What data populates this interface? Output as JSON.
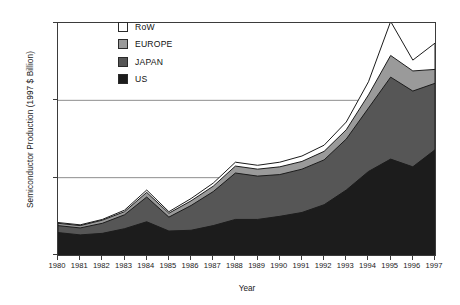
{
  "chart_data": {
    "type": "area",
    "stacked": true,
    "title": "",
    "xlabel": "Year",
    "ylabel": "Semiconductor Production (1997 $ Billion)",
    "x": [
      1980,
      1981,
      1982,
      1983,
      1984,
      1985,
      1986,
      1987,
      1988,
      1989,
      1990,
      1991,
      1992,
      1993,
      1994,
      1995,
      1996,
      1997
    ],
    "categories": [
      "1980",
      "1981",
      "1982",
      "1983",
      "1984",
      "1985",
      "1986",
      "1987",
      "1988",
      "1989",
      "1990",
      "1991",
      "1992",
      "1993",
      "1994",
      "1995",
      "1996",
      "1997"
    ],
    "xlim": [
      1980,
      1997
    ],
    "ylim": [
      0,
      150
    ],
    "yticks": [
      0,
      50,
      100,
      150
    ],
    "xticks": [
      "1980",
      "1981",
      "1982",
      "1983",
      "1984",
      "1985",
      "1986",
      "1987",
      "1988",
      "1989",
      "1990",
      "1991",
      "1992",
      "1993",
      "1994",
      "1995",
      "1996",
      "1997"
    ],
    "grid": "horizontal",
    "legend_position": "upper-left-inside",
    "series": [
      {
        "name": "US",
        "color": "#1c1c1c",
        "values": [
          14.5,
          13.0,
          14.0,
          17.0,
          21.5,
          15.5,
          16.0,
          19.0,
          23.0,
          23.0,
          25.0,
          27.5,
          32.5,
          42.0,
          54.0,
          62.0,
          57.0,
          68.0
        ]
      },
      {
        "name": "JAPAN",
        "color": "#565656",
        "values": [
          4.5,
          4.5,
          6.5,
          9.0,
          16.0,
          9.0,
          16.0,
          22.0,
          30.0,
          28.0,
          27.0,
          28.0,
          29.0,
          33.0,
          41.0,
          53.0,
          49.0,
          43.0
        ]
      },
      {
        "name": "EUROPE",
        "color": "#9a9a9a",
        "values": [
          1.5,
          1.5,
          2.0,
          2.0,
          3.0,
          2.5,
          3.0,
          3.5,
          4.5,
          4.5,
          5.0,
          5.0,
          5.5,
          6.0,
          8.5,
          14.0,
          13.0,
          9.0
        ]
      },
      {
        "name": "RoW",
        "color": "#ffffff",
        "values": [
          0.5,
          0.5,
          0.5,
          1.0,
          1.5,
          1.0,
          1.5,
          2.0,
          2.5,
          2.5,
          3.0,
          3.5,
          4.0,
          5.0,
          8.5,
          22.0,
          7.0,
          17.0
        ]
      }
    ],
    "totals": [
      21,
      19.5,
      23,
      29,
      42,
      28,
      36.5,
      46.5,
      60,
      58,
      60,
      64,
      71,
      86,
      112,
      151,
      126,
      137
    ],
    "legend_order_top_to_bottom": [
      "RoW",
      "EUROPE",
      "JAPAN",
      "US"
    ]
  },
  "legend": {
    "items": [
      {
        "label": "RoW",
        "color": "#ffffff"
      },
      {
        "label": "EUROPE",
        "color": "#9a9a9a"
      },
      {
        "label": "JAPAN",
        "color": "#565656"
      },
      {
        "label": "US",
        "color": "#1c1c1c"
      }
    ]
  },
  "axes": {
    "y_title": "Semiconductor Production (1997 $ Billion)",
    "x_title": "Year",
    "y_ticks": [
      "150",
      "100",
      "50",
      "0"
    ],
    "x_ticks": [
      "1980",
      "1981",
      "1982",
      "1983",
      "1984",
      "1985",
      "1986",
      "1987",
      "1988",
      "1989",
      "1990",
      "1991",
      "1992",
      "1993",
      "1994",
      "1995",
      "1996",
      "1997"
    ]
  },
  "style": {
    "frame_color": "#3b3b3b",
    "grid_color": "#8e8e8e",
    "text_color": "#1a1a1a",
    "background": "#ffffff"
  }
}
